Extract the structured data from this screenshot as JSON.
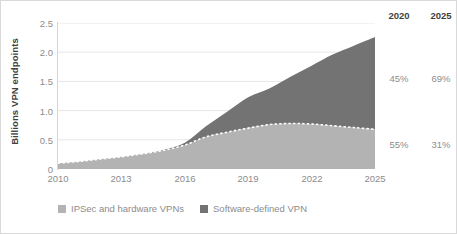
{
  "chart_data": {
    "type": "area",
    "stacked": true,
    "title": "",
    "xlabel": "",
    "ylabel": "Billions VPN endpoints",
    "xlim": [
      2010,
      2025
    ],
    "ylim": [
      0,
      2.5
    ],
    "grid": true,
    "legend_position": "bottom-left",
    "x": [
      2010,
      2011,
      2012,
      2013,
      2014,
      2015,
      2016,
      2017,
      2018,
      2019,
      2020,
      2021,
      2022,
      2023,
      2024,
      2025
    ],
    "xticks": [
      "2010",
      "2013",
      "2016",
      "2019",
      "2022",
      "2025"
    ],
    "yticks": [
      "0",
      "0.5",
      "1.0",
      "1.5",
      "2.0",
      "2.5"
    ],
    "series": [
      {
        "name": "IPSec and hardware VPNs",
        "color": "#b3b3b3",
        "values": [
          0.1,
          0.13,
          0.17,
          0.21,
          0.26,
          0.32,
          0.41,
          0.55,
          0.63,
          0.7,
          0.76,
          0.78,
          0.77,
          0.74,
          0.71,
          0.68
        ]
      },
      {
        "name": "Software-defined VPN",
        "color": "#737373",
        "values": [
          0.0,
          0.0,
          0.0,
          0.0,
          0.0,
          0.01,
          0.04,
          0.18,
          0.35,
          0.53,
          0.62,
          0.8,
          1.0,
          1.22,
          1.4,
          1.58
        ]
      }
    ],
    "boundary_line": {
      "style": "dashed",
      "color": "#ffffff"
    },
    "annotations": {
      "columns": [
        "2020",
        "2025"
      ],
      "rows": [
        {
          "series": "Software-defined VPN",
          "values": [
            "45%",
            "69%"
          ]
        },
        {
          "series": "IPSec and hardware VPNs",
          "values": [
            "55%",
            "31%"
          ]
        }
      ]
    }
  },
  "axes": {
    "ylabel": "Billions VPN endpoints",
    "yticks": [
      {
        "label": "2.5",
        "value": 2.5
      },
      {
        "label": "2.0",
        "value": 2.0
      },
      {
        "label": "1.5",
        "value": 1.5
      },
      {
        "label": "1.0",
        "value": 1.0
      },
      {
        "label": "0.5",
        "value": 0.5
      },
      {
        "label": "0",
        "value": 0
      }
    ],
    "xticks": [
      {
        "label": "2010",
        "value": 2010
      },
      {
        "label": "2013",
        "value": 2013
      },
      {
        "label": "2016",
        "value": 2016
      },
      {
        "label": "2019",
        "value": 2019
      },
      {
        "label": "2022",
        "value": 2022
      },
      {
        "label": "2025",
        "value": 2025
      }
    ]
  },
  "legend": {
    "items": [
      {
        "label": "IPSec and hardware VPNs",
        "color": "#b3b3b3"
      },
      {
        "label": "Software-defined VPN",
        "color": "#737373"
      }
    ]
  },
  "side_table": {
    "headers": [
      "2020",
      "2025"
    ],
    "upper": [
      "45%",
      "69%"
    ],
    "lower": [
      "55%",
      "31%"
    ]
  }
}
